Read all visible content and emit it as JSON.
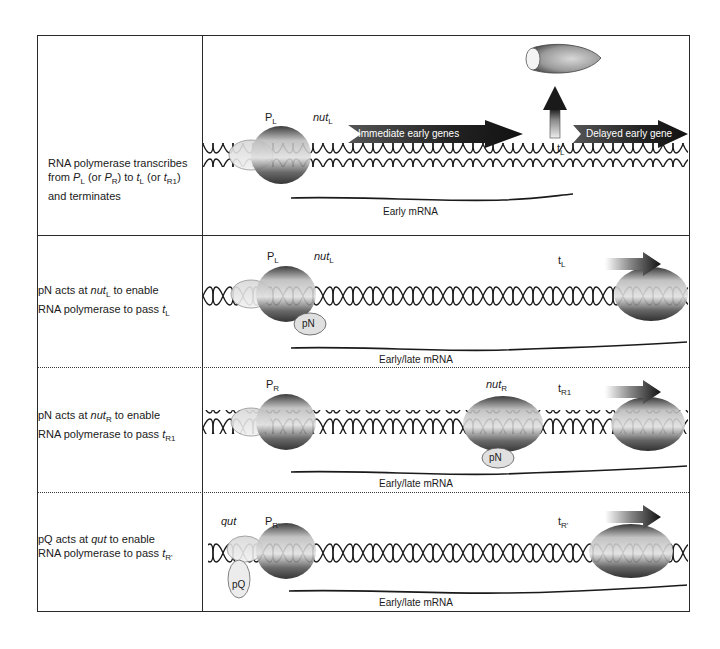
{
  "rows": [
    {
      "description": {
        "line1": "RNA polymerase transcribes",
        "line2_from": "from",
        "line2_P": "P",
        "line2_P_sub": "L",
        "line2_or1": "(or",
        "line2_P2": "P",
        "line2_P2_sub": "R",
        "line2_to": ") to",
        "line2_t": "t",
        "line2_t_sub": "L",
        "line2_or2": "(or",
        "line2_t2": "t",
        "line2_t2_sub": "R1",
        "line2_close": ")",
        "line3": "and  terminates"
      },
      "labels": {
        "promoter": "P",
        "promoter_sub": "L",
        "nut": "nut",
        "nut_sub": "L",
        "terminator": "t",
        "terminator_sub": "L",
        "arrow1": "Immediate early genes",
        "arrow2": "Delayed early gene",
        "mrna": "Early mRNA"
      }
    },
    {
      "description": {
        "line1_a": "pN acts at",
        "line1_nut": "nut",
        "line1_nut_sub": "L",
        "line1_b": "to enable",
        "line2_a": "RNA polymerase to pass",
        "line2_t": "t",
        "line2_t_sub": "L"
      },
      "labels": {
        "promoter": "P",
        "promoter_sub": "L",
        "nut": "nut",
        "nut_sub": "L",
        "factor": "pN",
        "terminator": "t",
        "terminator_sub": "L",
        "mrna": "Early/late  mRNA"
      }
    },
    {
      "description": {
        "line1_a": "pN acts at",
        "line1_nut": "nut",
        "line1_nut_sub": "R",
        "line1_b": "to enable",
        "line2_a": "RNA polymerase to pass",
        "line2_t": "t",
        "line2_t_sub": "R1"
      },
      "labels": {
        "promoter": "P",
        "promoter_sub": "R",
        "nut": "nut",
        "nut_sub": "R",
        "factor": "pN",
        "terminator": "t",
        "terminator_sub": "R1",
        "mrna": "Early/late  mRNA"
      }
    },
    {
      "description": {
        "line1_a": "pQ acts at",
        "line1_qut": "qut",
        "line1_b": "to enable",
        "line2_a": "RNA polymerase to pass",
        "line2_t": "t",
        "line2_t_sub": "R'"
      },
      "labels": {
        "qut": "qut",
        "promoter": "P",
        "promoter_sub": "R'",
        "factor": "pQ",
        "terminator": "t",
        "terminator_sub": "R'",
        "mrna": "Early/late  mRNA"
      }
    }
  ],
  "colors": {
    "border": "#2a2a2a",
    "polymerase_dark": "#1e1e1e",
    "polymerase_light": "#c8c8c8",
    "dna_strand": "#1a1a1a"
  }
}
